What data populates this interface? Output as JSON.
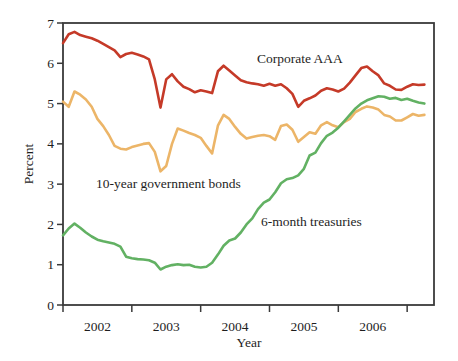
{
  "figure": {
    "background": "#ffffff",
    "axis_color": "#3a3a3a",
    "text_color": "#1e1e1e"
  },
  "chart_data": {
    "type": "line",
    "title": "",
    "xlabel": "Year",
    "ylabel": "Percent",
    "xlim": [
      2002,
      2007.39
    ],
    "ylim": [
      0,
      7
    ],
    "grid": false,
    "legend": "inline-annotations",
    "y_ticks": [
      0,
      1,
      2,
      3,
      4,
      5,
      6,
      7
    ],
    "x_ticks": [
      2002,
      2003,
      2004,
      2005,
      2006,
      2007
    ],
    "x_interval_labels": [
      "2002",
      "2003",
      "2004",
      "2005",
      "2006"
    ],
    "x_monthly_start": 2002.0,
    "x_note": "monthly observations, Jan 2002 through Apr 2007",
    "series": [
      {
        "name": "Corporate AAA",
        "color": "#c53a28",
        "values": [
          6.5,
          6.72,
          6.78,
          6.7,
          6.66,
          6.62,
          6.56,
          6.48,
          6.4,
          6.32,
          6.15,
          6.23,
          6.26,
          6.22,
          6.17,
          6.1,
          5.6,
          4.9,
          5.6,
          5.73,
          5.55,
          5.42,
          5.36,
          5.28,
          5.33,
          5.3,
          5.26,
          5.8,
          5.94,
          5.82,
          5.7,
          5.58,
          5.53,
          5.5,
          5.48,
          5.44,
          5.49,
          5.44,
          5.48,
          5.38,
          5.24,
          4.92,
          5.07,
          5.13,
          5.2,
          5.32,
          5.38,
          5.35,
          5.3,
          5.37,
          5.52,
          5.7,
          5.88,
          5.92,
          5.8,
          5.7,
          5.5,
          5.44,
          5.35,
          5.34,
          5.42,
          5.48,
          5.46,
          5.47
        ]
      },
      {
        "name": "10-year government bonds",
        "color": "#ecb568",
        "values": [
          5.05,
          4.92,
          5.3,
          5.22,
          5.1,
          4.92,
          4.62,
          4.44,
          4.22,
          3.95,
          3.88,
          3.86,
          3.92,
          3.96,
          4.0,
          4.02,
          3.8,
          3.32,
          3.45,
          4.0,
          4.38,
          4.33,
          4.27,
          4.22,
          4.15,
          3.95,
          3.76,
          4.45,
          4.72,
          4.62,
          4.42,
          4.25,
          4.13,
          4.17,
          4.2,
          4.22,
          4.19,
          4.1,
          4.44,
          4.48,
          4.35,
          4.05,
          4.17,
          4.29,
          4.25,
          4.46,
          4.54,
          4.46,
          4.41,
          4.54,
          4.62,
          4.79,
          4.87,
          4.93,
          4.9,
          4.85,
          4.72,
          4.68,
          4.58,
          4.58,
          4.66,
          4.74,
          4.7,
          4.72
        ]
      },
      {
        "name": "6-month treasuries",
        "color": "#62b163",
        "values": [
          1.73,
          1.9,
          2.02,
          1.92,
          1.8,
          1.7,
          1.62,
          1.58,
          1.55,
          1.52,
          1.45,
          1.2,
          1.16,
          1.14,
          1.13,
          1.11,
          1.05,
          0.88,
          0.95,
          0.99,
          1.01,
          0.99,
          1.0,
          0.95,
          0.93,
          0.95,
          1.05,
          1.25,
          1.47,
          1.6,
          1.65,
          1.8,
          2.0,
          2.15,
          2.38,
          2.54,
          2.62,
          2.8,
          3.02,
          3.12,
          3.15,
          3.22,
          3.38,
          3.71,
          3.78,
          4.02,
          4.2,
          4.28,
          4.4,
          4.56,
          4.72,
          4.88,
          5.0,
          5.08,
          5.13,
          5.18,
          5.17,
          5.12,
          5.14,
          5.09,
          5.12,
          5.07,
          5.03,
          5.0
        ]
      }
    ]
  }
}
